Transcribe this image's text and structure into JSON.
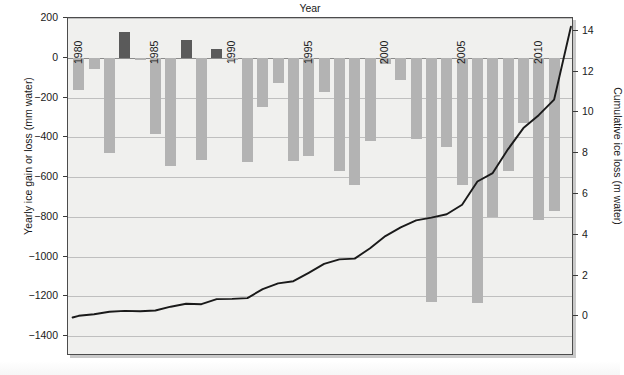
{
  "titles": {
    "x_axis": "Year",
    "y_axis_left": "Yearly ice gain or loss (mm water)",
    "y_axis_right": "Cumulative ice loss (m water)"
  },
  "caption": "",
  "chart_data": {
    "type": "bar",
    "title": "",
    "xlabel": "Year",
    "ylabel": "Yearly ice gain or loss (mm water)",
    "y2label": "Cumulative ice loss (m water)",
    "xlim": [
      1979.3,
      2012.3
    ],
    "ylim": [
      -1500,
      200
    ],
    "y2lim": [
      14.63,
      -1.95
    ],
    "grid": true,
    "legend": "none",
    "x_ticks": [
      1980,
      1985,
      1990,
      1995,
      2000,
      2005,
      2010
    ],
    "y_ticks": [
      200,
      0,
      -200,
      -400,
      -600,
      -800,
      -1000,
      -1200,
      -1400
    ],
    "y2_ticks": [
      0,
      2,
      4,
      6,
      8,
      10,
      12,
      14
    ],
    "colors": {
      "bar_negative": "#b3b3b3",
      "bar_positive": "#5a5a5a",
      "line": "#1a1a1a",
      "plot_background": "#f0f0ee",
      "gridline": "#bfbfbf",
      "axis": "#4c4c4c"
    },
    "series": [
      {
        "name": "Yearly ice gain or loss (mm water)",
        "type": "bar",
        "x": [
          1980,
          1981,
          1982,
          1983,
          1984,
          1985,
          1986,
          1987,
          1988,
          1989,
          1990,
          1991,
          1992,
          1993,
          1994,
          1995,
          1996,
          1997,
          1998,
          1999,
          2000,
          2001,
          2002,
          2003,
          2004,
          2005,
          2006,
          2007,
          2008,
          2009,
          2010,
          2011
        ],
        "values": [
          -160,
          -55,
          -480,
          130,
          -10,
          -385,
          -545,
          90,
          -515,
          45,
          -10,
          -525,
          -250,
          -125,
          -520,
          -495,
          -170,
          -570,
          -640,
          -420,
          -30,
          -110,
          -410,
          -1230,
          -450,
          -640,
          -1235,
          -800,
          -570,
          -330,
          -815,
          -770
        ]
      },
      {
        "name": "Cumulative ice loss (m water)",
        "type": "line",
        "x": [
          1980,
          1981,
          1982,
          1983,
          1984,
          1985,
          1986,
          1987,
          1988,
          1989,
          1990,
          1991,
          1992,
          1993,
          1994,
          1995,
          1996,
          1997,
          1998,
          1999,
          2000,
          2001,
          2002,
          2003,
          2004,
          2005,
          2006,
          2007,
          2008,
          2009,
          2010,
          2011
        ],
        "values": [
          0.02,
          0.1,
          0.22,
          0.26,
          0.25,
          0.28,
          0.47,
          0.61,
          0.59,
          0.84,
          0.85,
          0.89,
          1.33,
          1.61,
          1.72,
          2.13,
          2.57,
          2.79,
          2.83,
          3.34,
          3.93,
          4.36,
          4.7,
          4.84,
          5.0,
          5.47,
          6.61,
          7.02,
          8.2,
          9.23,
          9.86,
          10.62
        ],
        "values_raw_endpoint": 14.2
      }
    ]
  }
}
